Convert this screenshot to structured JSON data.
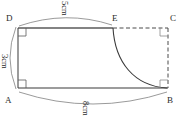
{
  "figure": {
    "stroke_color": "#3a3a3a",
    "fill_color": "#ffffff",
    "background": "#ffffff",
    "vertices": [
      {
        "id": "A",
        "label": "A",
        "x": 18,
        "y": 88
      },
      {
        "id": "B",
        "label": "B",
        "x": 168,
        "y": 88
      },
      {
        "id": "C",
        "label": "C",
        "x": 168,
        "y": 28
      },
      {
        "id": "D",
        "label": "D",
        "x": 18,
        "y": 28
      },
      {
        "id": "E",
        "label": "E",
        "x": 113,
        "y": 28
      }
    ],
    "dimensions": [
      {
        "id": "top",
        "label": "5cm",
        "from": "D",
        "to": "E",
        "rotated": true
      },
      {
        "id": "left",
        "label": "3cm",
        "from": "D",
        "to": "A",
        "rotated": true
      },
      {
        "id": "bottom",
        "label": "8cm",
        "from": "A",
        "to": "B",
        "rotated": true
      }
    ],
    "right_angles": [
      {
        "id": "angle-D",
        "at": "D"
      },
      {
        "id": "angle-A",
        "at": "A"
      },
      {
        "id": "angle-C",
        "at": "C"
      },
      {
        "id": "angle-B",
        "at": "B"
      }
    ],
    "edges": [
      {
        "id": "DE",
        "style": "solid",
        "from": "D",
        "to": "E"
      },
      {
        "id": "EC",
        "style": "dashed",
        "from": "E",
        "to": "C"
      },
      {
        "id": "CB",
        "style": "dashed",
        "from": "C",
        "to": "B"
      },
      {
        "id": "AB",
        "style": "solid",
        "from": "A",
        "to": "B"
      },
      {
        "id": "DA",
        "style": "solid",
        "from": "D",
        "to": "A"
      }
    ],
    "curve": {
      "id": "EB",
      "from": "E",
      "to": "B",
      "style": "solid",
      "shape": "concave-quarter-arc"
    }
  }
}
